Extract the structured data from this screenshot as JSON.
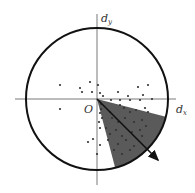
{
  "diagram": {
    "origin_label": "O",
    "x_axis_label": "d",
    "x_axis_sub": "x",
    "y_axis_label": "d",
    "y_axis_sub": "y",
    "colors": {
      "circle": "#111111",
      "axes": "#555555",
      "sector_fill": "#5a5a5a",
      "points": "#333333",
      "arrow": "#111111"
    },
    "circle": {
      "cx": 97,
      "cy": 99,
      "r": 71
    },
    "origin": {
      "x": 97,
      "y": 99
    },
    "sector": {
      "p1": [
        163,
        116
      ],
      "p2": [
        115,
        167
      ]
    },
    "arrow": {
      "x1": 97,
      "y1": 99,
      "x2": 158,
      "y2": 160
    },
    "points": [
      [
        60,
        85
      ],
      [
        90,
        82
      ],
      [
        80,
        88
      ],
      [
        82,
        92
      ],
      [
        98,
        85
      ],
      [
        92,
        92
      ],
      [
        100,
        93
      ],
      [
        103,
        96
      ],
      [
        118,
        92
      ],
      [
        138,
        87
      ],
      [
        148,
        85
      ],
      [
        128,
        96
      ],
      [
        140,
        100
      ],
      [
        152,
        99
      ],
      [
        111,
        100
      ],
      [
        120,
        100
      ],
      [
        130,
        100
      ],
      [
        143,
        95
      ],
      [
        60,
        109
      ],
      [
        101,
        104
      ],
      [
        101,
        109
      ],
      [
        100,
        113
      ],
      [
        99,
        122
      ],
      [
        100,
        128
      ],
      [
        102,
        118
      ],
      [
        110,
        112
      ],
      [
        120,
        105
      ],
      [
        124,
        108
      ],
      [
        130,
        112
      ],
      [
        136,
        110
      ],
      [
        145,
        108
      ],
      [
        148,
        112
      ],
      [
        112,
        118
      ],
      [
        118,
        122
      ],
      [
        125,
        118
      ],
      [
        134,
        122
      ],
      [
        142,
        120
      ],
      [
        106,
        128
      ],
      [
        110,
        134
      ],
      [
        116,
        130
      ],
      [
        122,
        136
      ],
      [
        132,
        132
      ],
      [
        140,
        130
      ],
      [
        146,
        126
      ],
      [
        108,
        140
      ],
      [
        118,
        144
      ],
      [
        126,
        140
      ],
      [
        134,
        146
      ],
      [
        142,
        136
      ],
      [
        114,
        150
      ],
      [
        122,
        154
      ],
      [
        130,
        150
      ],
      [
        88,
        142
      ],
      [
        93,
        139
      ],
      [
        100,
        145
      ],
      [
        97,
        154
      ]
    ]
  }
}
